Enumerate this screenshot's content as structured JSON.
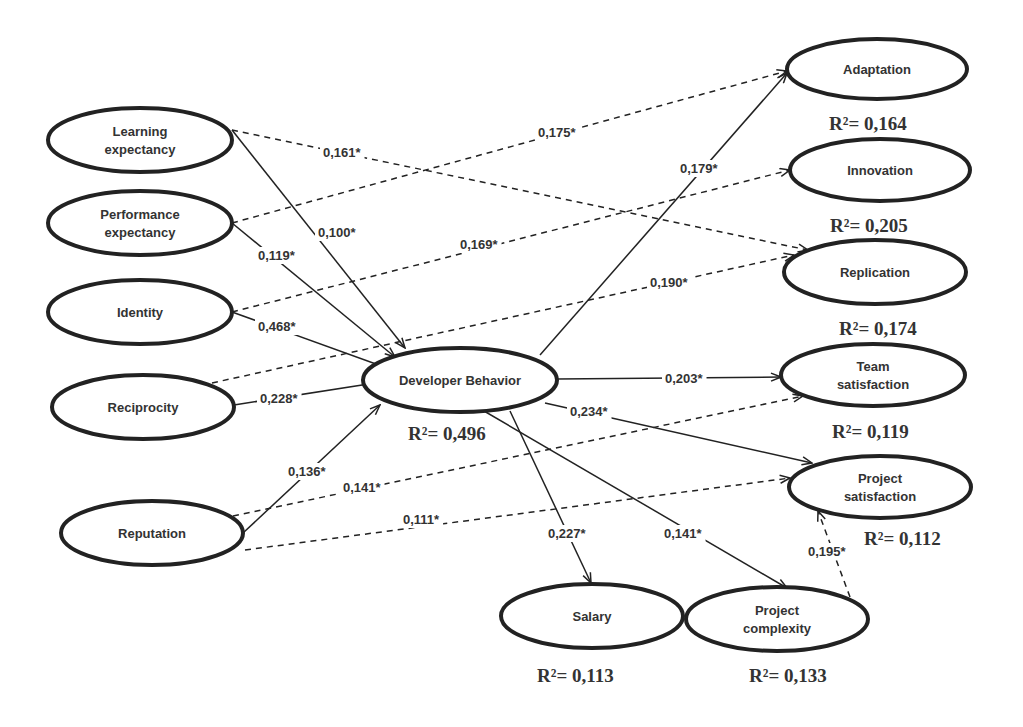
{
  "diagram": {
    "type": "structural-equation-model",
    "nodes": [
      {
        "id": "learning",
        "lines": [
          "Learning",
          "expectancy"
        ],
        "cx": 140,
        "cy": 140,
        "rx": 92,
        "ry": 32
      },
      {
        "id": "performance",
        "lines": [
          "Performance",
          "expectancy"
        ],
        "cx": 140,
        "cy": 223,
        "rx": 92,
        "ry": 32
      },
      {
        "id": "identity",
        "lines": [
          "Identity"
        ],
        "cx": 140,
        "cy": 312,
        "rx": 92,
        "ry": 32
      },
      {
        "id": "reciprocity",
        "lines": [
          "Reciprocity"
        ],
        "cx": 143,
        "cy": 407,
        "rx": 91,
        "ry": 32
      },
      {
        "id": "reputation",
        "lines": [
          "Reputation"
        ],
        "cx": 152,
        "cy": 533,
        "rx": 91,
        "ry": 32
      },
      {
        "id": "developer",
        "lines": [
          "Developer Behavior"
        ],
        "cx": 460,
        "cy": 380,
        "rx": 97,
        "ry": 32,
        "r2": "R²= 0,496",
        "r2x": 408,
        "r2y": 440
      },
      {
        "id": "adaptation",
        "lines": [
          "Adaptation"
        ],
        "cx": 877,
        "cy": 69,
        "rx": 90,
        "ry": 30,
        "r2": "R²= 0,164",
        "r2x": 829,
        "r2y": 130
      },
      {
        "id": "innovation",
        "lines": [
          "Innovation"
        ],
        "cx": 880,
        "cy": 170,
        "rx": 90,
        "ry": 31,
        "r2": "R²= 0,205",
        "r2x": 830,
        "r2y": 232
      },
      {
        "id": "replication",
        "lines": [
          "Replication"
        ],
        "cx": 875,
        "cy": 272,
        "rx": 91,
        "ry": 32,
        "r2": "R²= 0,174",
        "r2x": 839,
        "r2y": 335
      },
      {
        "id": "team",
        "lines": [
          "Team",
          "satisfaction"
        ],
        "cx": 873,
        "cy": 375,
        "rx": 92,
        "ry": 31,
        "r2": "R²= 0,119",
        "r2x": 832,
        "r2y": 438
      },
      {
        "id": "projsat",
        "lines": [
          "Project",
          "satisfaction"
        ],
        "cx": 880,
        "cy": 487,
        "rx": 91,
        "ry": 31,
        "r2": "R²= 0,112",
        "r2x": 864,
        "r2y": 545
      },
      {
        "id": "salary",
        "lines": [
          "Salary"
        ],
        "cx": 592,
        "cy": 616,
        "rx": 91,
        "ry": 32,
        "r2": "R²= 0,113",
        "r2x": 537,
        "r2y": 682
      },
      {
        "id": "complexity",
        "lines": [
          "Project",
          "complexity"
        ],
        "cx": 777,
        "cy": 619,
        "rx": 91,
        "ry": 32,
        "r2": "R²= 0,133",
        "r2x": 749,
        "r2y": 682
      }
    ],
    "edges": [
      {
        "from": "learning",
        "to": "developer",
        "coef": "0,100*",
        "style": "solid",
        "x1": 232,
        "y1": 130,
        "x2": 405,
        "y2": 348,
        "lx": 318,
        "ly": 237
      },
      {
        "from": "learning",
        "to": "replication",
        "coef": "0,161*",
        "style": "dashed",
        "x1": 232,
        "y1": 130,
        "x2": 808,
        "y2": 250,
        "lx": 323,
        "ly": 157
      },
      {
        "from": "performance",
        "to": "developer",
        "coef": "0,119*",
        "style": "solid",
        "x1": 232,
        "y1": 223,
        "x2": 395,
        "y2": 357,
        "lx": 258,
        "ly": 260
      },
      {
        "from": "performance",
        "to": "adaptation",
        "coef": "0,175*",
        "style": "dashed",
        "x1": 232,
        "y1": 223,
        "x2": 787,
        "y2": 71,
        "lx": 538,
        "ly": 137
      },
      {
        "from": "identity",
        "to": "innovation",
        "coef": "0,169*",
        "style": "dashed",
        "x1": 232,
        "y1": 312,
        "x2": 790,
        "y2": 170,
        "lx": 460,
        "ly": 249
      },
      {
        "from": "identity",
        "to": "developer",
        "coef": "0,468*",
        "style": "solid",
        "x1": 232,
        "y1": 312,
        "x2": 387,
        "y2": 368,
        "lx": 258,
        "ly": 331
      },
      {
        "from": "reciprocity",
        "to": "replication",
        "coef": "0,190*",
        "style": "dashed",
        "x1": 212,
        "y1": 383,
        "x2": 794,
        "y2": 255,
        "lx": 650,
        "ly": 287
      },
      {
        "from": "reciprocity",
        "to": "developer",
        "coef": "0,228*",
        "style": "solid",
        "x1": 234,
        "y1": 405,
        "x2": 375,
        "y2": 383,
        "lx": 260,
        "ly": 403
      },
      {
        "from": "reputation",
        "to": "developer",
        "coef": "0,136*",
        "style": "solid",
        "x1": 243,
        "y1": 533,
        "x2": 380,
        "y2": 405,
        "lx": 288,
        "ly": 476
      },
      {
        "from": "reputation",
        "to": "team",
        "coef": "0,141*",
        "style": "dashed",
        "x1": 233,
        "y1": 516,
        "x2": 803,
        "y2": 396,
        "lx": 343,
        "ly": 492
      },
      {
        "from": "reputation",
        "to": "projsat",
        "coef": "0,111*",
        "style": "dashed",
        "x1": 245,
        "y1": 550,
        "x2": 790,
        "y2": 478,
        "lx": 403,
        "ly": 524
      },
      {
        "from": "developer",
        "to": "adaptation",
        "coef": "0,179*",
        "style": "solid",
        "x1": 540,
        "y1": 355,
        "x2": 787,
        "y2": 73,
        "lx": 680,
        "ly": 173
      },
      {
        "from": "developer",
        "to": "team",
        "coef": "0,203*",
        "style": "solid",
        "x1": 557,
        "y1": 379,
        "x2": 781,
        "y2": 377,
        "lx": 665,
        "ly": 383
      },
      {
        "from": "developer",
        "to": "projsat",
        "coef": "0,234*",
        "style": "solid",
        "x1": 545,
        "y1": 403,
        "x2": 812,
        "y2": 463,
        "lx": 570,
        "ly": 416
      },
      {
        "from": "developer",
        "to": "salary",
        "coef": "0,227*",
        "style": "solid",
        "x1": 510,
        "y1": 411,
        "x2": 591,
        "y2": 583,
        "lx": 548,
        "ly": 538
      },
      {
        "from": "developer",
        "to": "complexity",
        "coef": "0,141*",
        "style": "solid",
        "x1": 484,
        "y1": 411,
        "x2": 787,
        "y2": 588,
        "lx": 664,
        "ly": 538
      },
      {
        "from": "complexity",
        "to": "projsat",
        "coef": "0,195*",
        "style": "dashed",
        "x1": 850,
        "y1": 597,
        "x2": 818,
        "y2": 511,
        "lx": 808,
        "ly": 556
      }
    ]
  }
}
